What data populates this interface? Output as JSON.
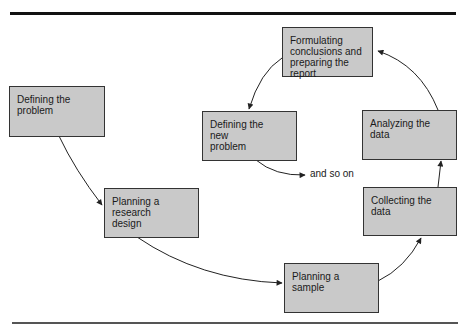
{
  "diagram": {
    "type": "cyclic-flowchart",
    "nodes": [
      {
        "id": "define",
        "label": "Defining the\nproblem"
      },
      {
        "id": "research",
        "label": "Planning a\nresearch\ndesign"
      },
      {
        "id": "sample",
        "label": "Planning a\nsample"
      },
      {
        "id": "collect",
        "label": "Collecting the\ndata"
      },
      {
        "id": "analyze",
        "label": "Analyzing the\ndata"
      },
      {
        "id": "conclude",
        "label": "Formulating\nconclusions and\npreparing the report"
      },
      {
        "id": "newproblem",
        "label": "Defining the\nnew\nproblem"
      }
    ],
    "edges": [
      {
        "from": "define",
        "to": "research"
      },
      {
        "from": "research",
        "to": "sample"
      },
      {
        "from": "sample",
        "to": "collect"
      },
      {
        "from": "collect",
        "to": "analyze"
      },
      {
        "from": "analyze",
        "to": "conclude"
      },
      {
        "from": "conclude",
        "to": "newproblem"
      },
      {
        "from": "newproblem",
        "to": "continuation"
      }
    ],
    "continuation_label": "and so on",
    "colors": {
      "box_fill": "#c9c9c9",
      "box_border": "#333333",
      "arrow": "#222222",
      "rule": "#111111"
    }
  }
}
